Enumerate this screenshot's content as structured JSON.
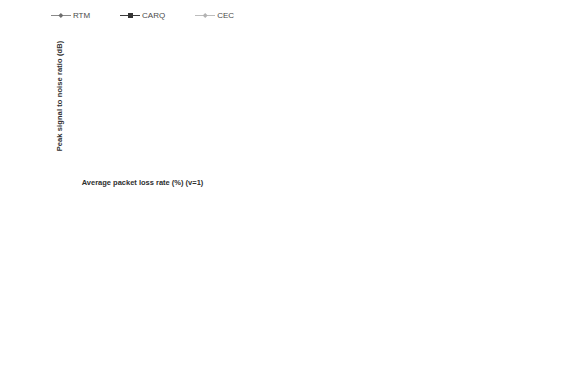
{
  "figure": {
    "top_clipped_text": "· · · · ·",
    "legend": [
      {
        "name": "RTM",
        "color": "#8a8a8a",
        "marker": "diamond"
      },
      {
        "name": "CARQ",
        "color": "#343434",
        "marker": "square"
      },
      {
        "name": "CEC",
        "color": "#b9b9b9",
        "marker": "diamond"
      }
    ]
  },
  "chart_data": [
    {
      "type": "line",
      "title": "",
      "xlabel": "Average packet loss rate (%) (v=1)",
      "ylabel": "Peak signal to noise ratio (dB)",
      "x": [
        2,
        4,
        6,
        8,
        10,
        12,
        14,
        16,
        18,
        20,
        22,
        24,
        26,
        28,
        30
      ],
      "xlim": [
        1,
        31
      ],
      "ylim": [
        0,
        40
      ],
      "yticks": [
        0,
        5,
        10,
        15,
        20,
        25,
        30,
        35,
        40
      ],
      "xticks": [
        2,
        4,
        6,
        8,
        10,
        12,
        14,
        16,
        18,
        20,
        22,
        24,
        26,
        28,
        30
      ],
      "grid": true,
      "legend_position": "top",
      "series": [
        {
          "name": "RTM",
          "values": [
            35.4,
            35.2,
            35.0,
            34.8,
            34.5,
            33.9,
            33.4,
            32.8,
            32.1,
            31.3,
            30.4,
            29.3,
            28.4,
            27.1,
            25.8
          ]
        },
        {
          "name": "CARQ",
          "values": [
            32.7,
            31.4,
            30.0,
            28.7,
            27.3,
            25.7,
            24.4,
            23.0,
            21.5,
            20.1,
            18.7,
            17.3,
            15.9,
            14.6,
            13.2
          ]
        },
        {
          "name": "CEC",
          "values": [
            35.8,
            35.8,
            35.8,
            35.8,
            35.9,
            35.9,
            35.9,
            35.9,
            35.9,
            35.9,
            35.9,
            35.9,
            35.9,
            35.9,
            35.9
          ]
        }
      ]
    },
    {
      "type": "line",
      "title": "",
      "xlabel": "Average packet loss rate (%) (v=2)",
      "ylabel": "Peak signal to noise ratio (dB)",
      "x": [
        2,
        4,
        6,
        8,
        10,
        12,
        14,
        16,
        18,
        20,
        22,
        24,
        26,
        28,
        30
      ],
      "xlim": [
        1,
        31
      ],
      "ylim": [
        0,
        40
      ],
      "yticks": [
        0,
        5,
        10,
        15,
        20,
        25,
        30,
        35,
        40
      ],
      "xticks": [
        2,
        4,
        6,
        8,
        10,
        12,
        14,
        16,
        18,
        20,
        22,
        24,
        26,
        28,
        30
      ],
      "grid": true,
      "legend_position": "top",
      "series": [
        {
          "name": "RTM",
          "values": [
            35.5,
            35.2,
            35.0,
            34.6,
            34.0,
            33.5,
            33.0,
            31.9,
            31.9,
            31.5,
            30.5,
            29.4,
            28.4,
            27.1,
            25.8
          ]
        },
        {
          "name": "CARQ",
          "values": [
            35.9,
            35.3,
            35.0,
            34.5,
            33.8,
            33.2,
            32.5,
            31.5,
            29.9,
            28.8,
            27.8,
            26.2,
            24.9,
            24.0,
            22.5
          ]
        },
        {
          "name": "CEC",
          "values": [
            35.9,
            35.9,
            35.9,
            35.9,
            35.9,
            35.9,
            35.9,
            35.9,
            35.9,
            35.9,
            35.9,
            35.9,
            35.9,
            35.9,
            35.9
          ]
        }
      ]
    },
    {
      "type": "line",
      "title": "",
      "xlabel": "Average packet loss rate (%) (v=3)",
      "ylabel": "Peak signal to noise ratio (dB)",
      "x": [
        2,
        4,
        6,
        8,
        10,
        12,
        14,
        16,
        18,
        20,
        22,
        24,
        26,
        28,
        30
      ],
      "xlim": [
        1,
        31
      ],
      "ylim": [
        0,
        40
      ],
      "yticks": [
        0,
        5,
        10,
        15,
        20,
        25,
        30,
        35,
        40
      ],
      "xticks": [
        2,
        4,
        6,
        8,
        10,
        12,
        14,
        16,
        18,
        20,
        22,
        24,
        26,
        28,
        30
      ],
      "grid": true,
      "legend_position": "top",
      "series": [
        {
          "name": "RTM",
          "values": [
            35.4,
            35.5,
            35.3,
            35.1,
            34.9,
            34.6,
            34.0,
            33.5,
            32.7,
            31.8,
            30.7,
            29.4,
            28.5,
            27.3,
            25.9
          ]
        },
        {
          "name": "CARQ",
          "values": [
            36.1,
            35.9,
            35.6,
            35.2,
            34.9,
            34.6,
            34.1,
            33.6,
            33.0,
            32.6,
            32.3,
            31.5,
            30.5,
            29.7,
            28.7
          ]
        },
        {
          "name": "CEC",
          "values": [
            36.0,
            36.0,
            36.0,
            36.0,
            36.0,
            36.0,
            36.0,
            36.0,
            36.0,
            36.0,
            36.0,
            36.0,
            36.0,
            36.0,
            36.0
          ]
        }
      ]
    },
    {
      "type": "line",
      "title": "",
      "xlabel": "Average packet loss rate (%) (v=4)",
      "ylabel": "Peak signal to noise ratio (dB)",
      "x": [
        2,
        4,
        6,
        8,
        10,
        12,
        14,
        16,
        18,
        20,
        22,
        24,
        26,
        28,
        30
      ],
      "xlim": [
        1,
        31
      ],
      "ylim": [
        0,
        40
      ],
      "yticks": [
        0,
        5,
        10,
        15,
        20,
        25,
        30,
        35,
        40
      ],
      "xticks": [
        2,
        4,
        6,
        8,
        10,
        12,
        14,
        16,
        18,
        20,
        22,
        24,
        26,
        28,
        30
      ],
      "grid": true,
      "legend_position": "top",
      "series": [
        {
          "name": "RTM",
          "values": [
            35.5,
            35.4,
            35.4,
            35.3,
            35.0,
            34.9,
            34.4,
            33.5,
            32.3,
            31.3,
            30.4,
            29.4,
            28.4,
            27.2,
            25.9
          ]
        },
        {
          "name": "CARQ",
          "values": [
            36.2,
            35.9,
            35.7,
            35.5,
            35.2,
            35.0,
            34.7,
            34.6,
            34.4,
            34.2,
            33.8,
            33.5,
            33.2,
            32.6,
            31.6
          ]
        },
        {
          "name": "CEC",
          "values": [
            36.0,
            36.0,
            36.0,
            36.0,
            36.0,
            36.0,
            36.0,
            36.0,
            36.0,
            36.0,
            36.0,
            36.0,
            36.0,
            36.0,
            36.0
          ]
        }
      ]
    }
  ]
}
